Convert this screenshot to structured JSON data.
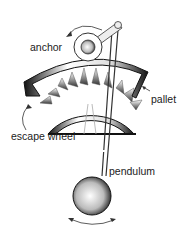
{
  "diagram": {
    "labels": {
      "anchor": "anchor",
      "pallet": "pallet",
      "escape_wheel": "escape wheel",
      "pendulum": "pendulum"
    },
    "colors": {
      "stroke": "#111111",
      "label": "#222222",
      "background": "#ffffff"
    }
  }
}
